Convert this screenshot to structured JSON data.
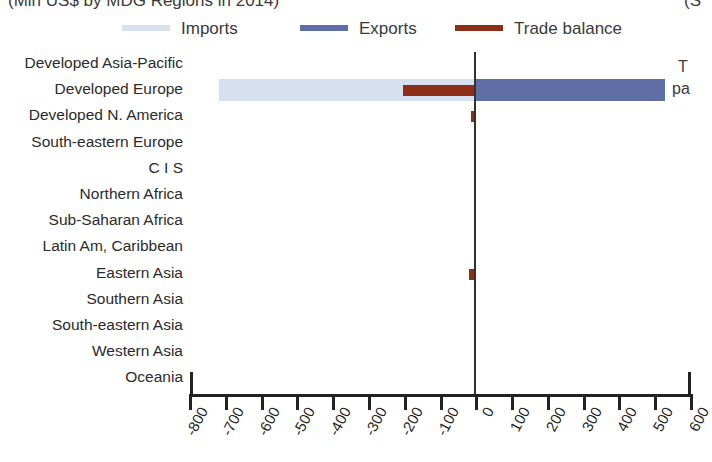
{
  "title": {
    "left_text": "(Mln US$ by MDG Regions in 2014)",
    "right_text": "(S"
  },
  "legend": {
    "position": "top",
    "items": [
      {
        "label": "Imports",
        "color": "#d6e0ef",
        "icon": "line-swatch-icon"
      },
      {
        "label": "Exports",
        "color": "#5f6ea4",
        "icon": "line-swatch-icon"
      },
      {
        "label": "Trade balance",
        "color": "#8e2d18",
        "icon": "line-swatch-icon"
      }
    ]
  },
  "right_annotation": {
    "line1": "T",
    "line2": "pa"
  },
  "axis": {
    "ticks": [
      "-800",
      "-700",
      "-600",
      "-500",
      "-400",
      "-300",
      "-200",
      "-100",
      "0",
      "100",
      "200",
      "300",
      "400",
      "500",
      "600"
    ]
  },
  "chart_data": {
    "type": "bar",
    "orientation": "horizontal",
    "title": "(Mln US$ by MDG Regions in 2014)",
    "xlabel": "",
    "ylabel": "",
    "xlim": [
      -800,
      600
    ],
    "xtick_step": 100,
    "grid": false,
    "legend_position": "top",
    "units": "Mln US$",
    "year": 2014,
    "categories": [
      "Developed Asia-Pacific",
      "Developed Europe",
      "Developed N. America",
      "South-eastern Europe",
      "C I S",
      "Northern Africa",
      "Sub-Saharan Africa",
      "Latin Am, Caribbean",
      "Eastern Asia",
      "Southern Asia",
      "South-eastern Asia",
      "Western Asia",
      "Oceania"
    ],
    "series": [
      {
        "name": "Imports",
        "color": "#d6e0ef",
        "values": [
          0,
          -720,
          0,
          0,
          0,
          0,
          0,
          0,
          0,
          0,
          0,
          0,
          0
        ]
      },
      {
        "name": "Exports",
        "color": "#5f6ea4",
        "values": [
          0,
          527,
          0,
          0,
          0,
          0,
          0,
          0,
          0,
          0,
          0,
          0,
          0
        ]
      },
      {
        "name": "Trade balance",
        "color": "#8e2d18",
        "values": [
          0,
          -205,
          -15,
          0,
          0,
          0,
          0,
          0,
          -20,
          0,
          0,
          0,
          0
        ]
      }
    ]
  }
}
